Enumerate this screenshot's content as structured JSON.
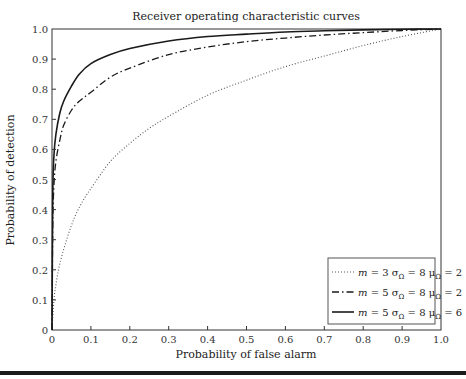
{
  "chart_data": {
    "type": "line",
    "title": "Receiver operating characteristic curves",
    "xlabel": "Probability of false alarm",
    "ylabel": "Probability of detection",
    "xlim": [
      0,
      1.0
    ],
    "ylim": [
      0,
      1.0
    ],
    "xticks": [
      "0",
      "0.1",
      "0.2",
      "0.3",
      "0.4",
      "0.5",
      "0.6",
      "0.7",
      "0.8",
      "0.9",
      "1.0"
    ],
    "yticks": [
      "0",
      "0.1",
      "0.2",
      "0.3",
      "0.4",
      "0.5",
      "0.6",
      "0.7",
      "0.8",
      "0.9",
      "1.0"
    ],
    "grid": false,
    "legend_position": "lower right",
    "series": [
      {
        "name": "m = 3 σΩ = 8 μΩ = 2",
        "legend": {
          "m": "3",
          "sigma": "8",
          "mu": "2"
        },
        "style": "dotted",
        "x": [
          0,
          0.005,
          0.01,
          0.02,
          0.04,
          0.06,
          0.08,
          0.1,
          0.15,
          0.2,
          0.25,
          0.3,
          0.4,
          0.5,
          0.6,
          0.7,
          0.8,
          0.9,
          1.0
        ],
        "y": [
          0,
          0.1,
          0.15,
          0.22,
          0.31,
          0.38,
          0.43,
          0.47,
          0.56,
          0.62,
          0.67,
          0.71,
          0.78,
          0.83,
          0.875,
          0.91,
          0.945,
          0.975,
          1.0
        ]
      },
      {
        "name": "m = 5 σΩ = 8 μΩ = 2",
        "legend": {
          "m": "5",
          "sigma": "8",
          "mu": "2"
        },
        "style": "dashdot",
        "x": [
          0,
          0.002,
          0.005,
          0.01,
          0.02,
          0.03,
          0.05,
          0.07,
          0.1,
          0.15,
          0.2,
          0.3,
          0.4,
          0.5,
          0.6,
          0.7,
          0.8,
          0.9,
          1.0
        ],
        "y": [
          0,
          0.35,
          0.48,
          0.56,
          0.63,
          0.68,
          0.73,
          0.76,
          0.79,
          0.84,
          0.87,
          0.915,
          0.94,
          0.958,
          0.97,
          0.98,
          0.988,
          0.995,
          1.0
        ]
      },
      {
        "name": "m = 5 σΩ = 8 μΩ = 6",
        "legend": {
          "m": "5",
          "sigma": "8",
          "mu": "6"
        },
        "style": "solid",
        "x": [
          0,
          0.002,
          0.005,
          0.01,
          0.02,
          0.03,
          0.05,
          0.07,
          0.1,
          0.15,
          0.2,
          0.3,
          0.4,
          0.5,
          0.6,
          0.7,
          0.8,
          0.9,
          1.0
        ],
        "y": [
          0,
          0.45,
          0.58,
          0.65,
          0.72,
          0.76,
          0.81,
          0.85,
          0.885,
          0.915,
          0.935,
          0.96,
          0.975,
          0.983,
          0.99,
          0.994,
          0.997,
          0.999,
          1.0
        ]
      }
    ]
  }
}
